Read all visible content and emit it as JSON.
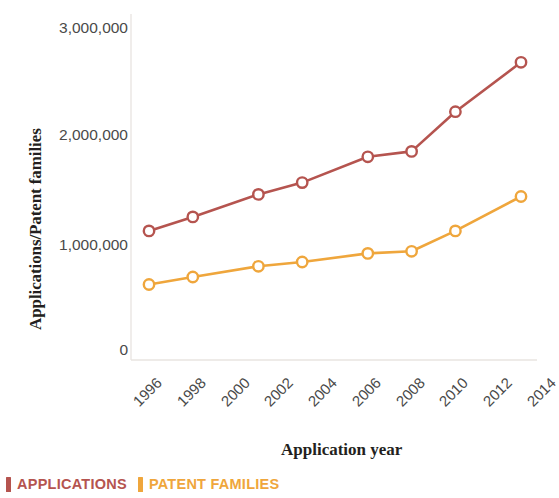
{
  "chart_data": {
    "type": "line",
    "title": "",
    "xlabel": "Application year",
    "ylabel": "Applications/Patent families",
    "x": [
      1996,
      1998,
      2001,
      2003,
      2006,
      2008,
      2010,
      2013
    ],
    "xlim": [
      1995,
      2014.5
    ],
    "ylim": [
      0,
      3000000
    ],
    "grid": false,
    "legend_position": "bottom-left",
    "y_ticks": [
      "0",
      "1,000,000",
      "2,000,000",
      "3,000,000"
    ],
    "y_tick_values": [
      0,
      1000000,
      2000000,
      3000000
    ],
    "x_ticks": [
      "1996",
      "1998",
      "2000",
      "2002",
      "2004",
      "2006",
      "2008",
      "2010",
      "2012",
      "2014"
    ],
    "x_tick_values": [
      1996,
      1998,
      2000,
      2002,
      2004,
      2006,
      2008,
      2010,
      2012,
      2014
    ],
    "series": [
      {
        "name": "APPLICATIONS",
        "color": "#b5544f",
        "marker": "open-circle",
        "values": [
          1110000,
          1240000,
          1450000,
          1560000,
          1800000,
          1850000,
          2220000,
          2680000
        ]
      },
      {
        "name": "PATENT FAMILIES",
        "color": "#efa63c",
        "marker": "open-circle",
        "values": [
          610000,
          680000,
          780000,
          820000,
          900000,
          920000,
          1110000,
          1430000
        ]
      }
    ]
  },
  "legend": {
    "items": [
      {
        "label": "APPLICATIONS",
        "color": "#b5544f"
      },
      {
        "label": "PATENT FAMILIES",
        "color": "#efa63c"
      }
    ]
  }
}
